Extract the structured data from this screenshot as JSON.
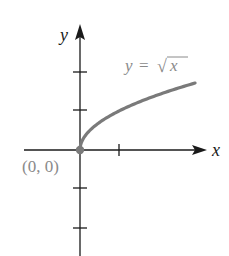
{
  "chart_data": {
    "type": "line",
    "title": "",
    "xlabel": "x",
    "ylabel": "y",
    "function_label": "y = √x",
    "function_label_parts": {
      "lhs": "y",
      "eq": "=",
      "radical": "√",
      "radicand": "x"
    },
    "point_label": "(0, 0)",
    "series": [
      {
        "name": "y = √x",
        "x": [
          0,
          0.25,
          0.5,
          1,
          1.5,
          2,
          2.5,
          2.95
        ],
        "y": [
          0,
          0.5,
          0.707,
          1,
          1.225,
          1.414,
          1.581,
          1.718
        ]
      }
    ],
    "highlight_points": [
      {
        "x": 0,
        "y": 0,
        "label": "(0, 0)"
      }
    ],
    "x_ticks": [
      1
    ],
    "y_ticks": [
      -2,
      -1,
      1,
      2
    ],
    "xlim": [
      -1.4,
      3.2
    ],
    "ylim": [
      -2.7,
      3.2
    ],
    "grid": false,
    "legend": "none",
    "colors": {
      "axes": "#1a1a1a",
      "curve": "#7a7a7a",
      "label": "#8a8a8a",
      "point": "#7a7a7a"
    }
  }
}
